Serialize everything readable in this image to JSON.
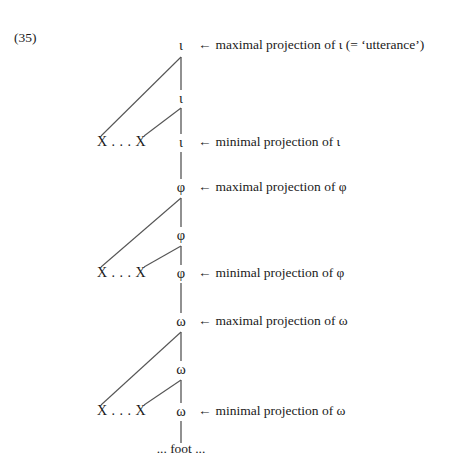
{
  "example": {
    "number": "(35)"
  },
  "colors": {
    "background": "#ffffff",
    "ink": "#1a1a1a",
    "line": "#555555"
  },
  "tree": {
    "spine_x": 181,
    "nodes": [
      {
        "id": "iota-max",
        "label": "ι",
        "x": 181,
        "y": 45,
        "tier": "iota",
        "role": "maximal"
      },
      {
        "id": "iota-mid",
        "label": "ι",
        "x": 181,
        "y": 98,
        "tier": "iota",
        "role": "intermediate"
      },
      {
        "id": "iota-min",
        "label": "ι",
        "x": 181,
        "y": 142,
        "tier": "iota",
        "role": "minimal"
      },
      {
        "id": "phi-max",
        "label": "φ",
        "x": 181,
        "y": 187,
        "tier": "phi",
        "role": "maximal"
      },
      {
        "id": "phi-mid",
        "label": "φ",
        "x": 181,
        "y": 235,
        "tier": "phi",
        "role": "intermediate"
      },
      {
        "id": "phi-min",
        "label": "φ",
        "x": 181,
        "y": 273,
        "tier": "phi",
        "role": "minimal"
      },
      {
        "id": "omega-max",
        "label": "ω",
        "x": 181,
        "y": 321,
        "tier": "omega",
        "role": "maximal"
      },
      {
        "id": "omega-mid",
        "label": "ω",
        "x": 181,
        "y": 369,
        "tier": "omega",
        "role": "intermediate"
      },
      {
        "id": "omega-min",
        "label": "ω",
        "x": 181,
        "y": 411,
        "tier": "omega",
        "role": "minimal"
      }
    ],
    "adjuncts": [
      {
        "id": "adjunct-iota",
        "label": "X . . . X",
        "x": 97,
        "y": 142,
        "tier": "iota"
      },
      {
        "id": "adjunct-phi",
        "label": "X . . . X",
        "x": 97,
        "y": 273,
        "tier": "phi"
      },
      {
        "id": "adjunct-omega",
        "label": "X . . . X",
        "x": 97,
        "y": 411,
        "tier": "omega"
      }
    ],
    "branches": [
      {
        "id": "iota-long",
        "x1": 181,
        "y1": 57,
        "x2": 101,
        "y2": 136
      },
      {
        "id": "iota-short",
        "x1": 181,
        "y1": 108,
        "x2": 144,
        "y2": 136
      },
      {
        "id": "phi-long",
        "x1": 181,
        "y1": 198,
        "x2": 101,
        "y2": 267
      },
      {
        "id": "phi-short",
        "x1": 181,
        "y1": 246,
        "x2": 144,
        "y2": 267
      },
      {
        "id": "omega-long",
        "x1": 181,
        "y1": 332,
        "x2": 101,
        "y2": 405
      },
      {
        "id": "omega-short",
        "x1": 181,
        "y1": 380,
        "x2": 144,
        "y2": 405
      }
    ],
    "spines": [
      {
        "id": "spine-iota-max-mid",
        "x": 181,
        "y1": 57,
        "y2": 90
      },
      {
        "id": "spine-iota-mid-min",
        "x": 181,
        "y1": 108,
        "y2": 134
      },
      {
        "id": "spine-iota-min-phi",
        "x": 181,
        "y1": 152,
        "y2": 179
      },
      {
        "id": "spine-phi-max-mid",
        "x": 181,
        "y1": 198,
        "y2": 227
      },
      {
        "id": "spine-phi-mid-min",
        "x": 181,
        "y1": 246,
        "y2": 265
      },
      {
        "id": "spine-phi-min-omega",
        "x": 181,
        "y1": 283,
        "y2": 313
      },
      {
        "id": "spine-omega-max-mid",
        "x": 181,
        "y1": 332,
        "y2": 361
      },
      {
        "id": "spine-omega-mid-min",
        "x": 181,
        "y1": 380,
        "y2": 403
      },
      {
        "id": "spine-omega-min-foot",
        "x": 181,
        "y1": 421,
        "y2": 443
      }
    ]
  },
  "annotations": [
    {
      "id": "ann-iota-max",
      "arrow": "←",
      "text": "maximal projection of ι (= ‘utterance’)",
      "x": 198,
      "y": 45
    },
    {
      "id": "ann-iota-min",
      "arrow": "←",
      "text": "minimal projection of ι",
      "x": 198,
      "y": 142
    },
    {
      "id": "ann-phi-max",
      "arrow": "←",
      "text": "maximal projection of φ",
      "x": 198,
      "y": 187
    },
    {
      "id": "ann-phi-min",
      "arrow": "←",
      "text": "minimal projection of φ",
      "x": 198,
      "y": 273
    },
    {
      "id": "ann-omega-max",
      "arrow": "←",
      "text": "maximal projection of ω",
      "x": 198,
      "y": 321
    },
    {
      "id": "ann-omega-min",
      "arrow": "←",
      "text": "minimal projection of ω",
      "x": 198,
      "y": 411
    }
  ],
  "foot": {
    "label": "... foot ...",
    "x": 181,
    "y": 449
  }
}
